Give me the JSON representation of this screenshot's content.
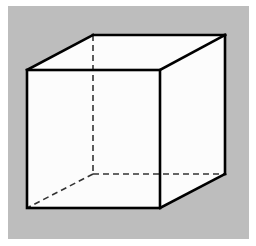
{
  "diagram": {
    "colors": {
      "page_background": "#ffffff",
      "panel_background": "#bdbdbd",
      "face_fill": "#fcfcfc",
      "edge_color": "#000000",
      "hidden_edge_color": "#333333"
    },
    "vertices": {
      "front_top_left": [
        27,
        70
      ],
      "front_top_right": [
        160,
        70
      ],
      "front_bottom_right": [
        160,
        208
      ],
      "front_bottom_left": [
        27,
        208
      ],
      "back_top_left": [
        93,
        35
      ],
      "back_top_right": [
        225,
        35
      ],
      "back_bottom_right": [
        225,
        174
      ],
      "back_bottom_left": [
        93,
        174
      ]
    },
    "visible_edges": 9,
    "hidden_edges": 3,
    "hidden_edge_style": "dashed"
  }
}
